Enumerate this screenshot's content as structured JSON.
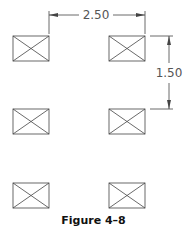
{
  "figure": {
    "caption": "Figure 4–8",
    "dimensions": {
      "horizontal": "2.50",
      "vertical": "1.50"
    },
    "grid": {
      "rows": 3,
      "columns": 2,
      "symbol": "rectangle-with-x"
    },
    "colors": {
      "line": "#444444",
      "text": "#555555"
    }
  }
}
